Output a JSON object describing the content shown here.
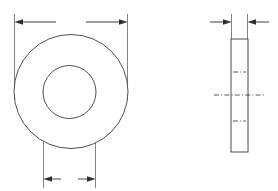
{
  "drawing": {
    "title": "Flat washer — two-view engineering drawing",
    "background_color": "#ffffff",
    "line_color": "#3a3a3a",
    "dimension_color": "#2e2e2e",
    "extension_line_color": "#5a5a5a",
    "canvas": {
      "width": 278,
      "height": 191
    }
  },
  "views": {
    "front": {
      "name": "front-view",
      "label": "",
      "outer_circle": {
        "cx": 71,
        "cy": 91.5,
        "r": 57,
        "label": ""
      },
      "inner_circle": {
        "cx": 69.5,
        "cy": 92,
        "r": 26.5,
        "label": ""
      },
      "dimensions": [
        {
          "name": "outside-diameter-dimension",
          "label": "",
          "placement": "top",
          "line_y": 22,
          "from_x": 14,
          "to_x": 128,
          "arrow_direction": "outward",
          "text_gap": [
            56,
            86
          ]
        },
        {
          "name": "inside-diameter-dimension",
          "label": "",
          "placement": "bottom",
          "line_y": 179,
          "from_x": 43,
          "to_x": 96,
          "arrow_direction": "outward",
          "text_gap": [
            60,
            79
          ]
        }
      ]
    },
    "side": {
      "name": "side-view",
      "label": "",
      "rect": {
        "x": 231,
        "y": 39,
        "width": 17,
        "height": 113,
        "label": ""
      },
      "centerlines": [
        {
          "name": "upper-centerline",
          "y": 72,
          "from_x": 233,
          "to_x": 246
        },
        {
          "name": "main-centerline",
          "y": 95,
          "from_x": 214,
          "to_x": 265
        },
        {
          "name": "lower-centerline",
          "y": 121,
          "from_x": 233,
          "to_x": 246
        }
      ],
      "dimensions": [
        {
          "name": "thickness-dimension",
          "label": "",
          "placement": "top",
          "line_y": 22,
          "from_x": 231,
          "to_x": 248,
          "arrow_direction": "inward",
          "lead_left_from_x": 210,
          "lead_right_to_x": 269
        }
      ]
    }
  }
}
